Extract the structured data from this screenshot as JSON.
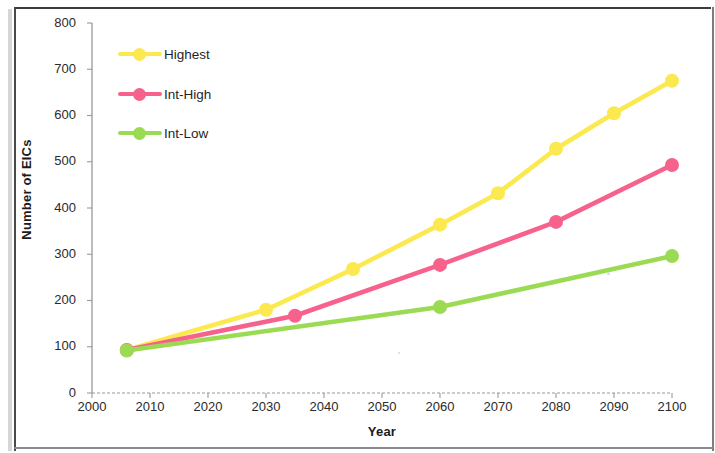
{
  "chart_data": {
    "type": "line",
    "title": "",
    "xlabel": "Year",
    "ylabel": "Number of EICs",
    "xlim": [
      2000,
      2100
    ],
    "ylim": [
      0,
      800
    ],
    "xticks": [
      2000,
      2010,
      2020,
      2030,
      2040,
      2050,
      2060,
      2070,
      2080,
      2090,
      2100
    ],
    "yticks": [
      0,
      100,
      200,
      300,
      400,
      500,
      600,
      700,
      800
    ],
    "grid": false,
    "legend_position": "upper-left-inside",
    "series": [
      {
        "name": "Highest",
        "color": "#FBE94F",
        "x": [
          2006,
          2030,
          2045,
          2060,
          2070,
          2080,
          2090,
          2100
        ],
        "values": [
          93,
          180,
          268,
          364,
          432,
          528,
          605,
          675
        ]
      },
      {
        "name": "Int-High",
        "color": "#F7628C",
        "x": [
          2006,
          2035,
          2060,
          2080,
          2100
        ],
        "values": [
          93,
          167,
          277,
          370,
          493
        ]
      },
      {
        "name": "Int-Low",
        "color": "#9BDB54",
        "x": [
          2006,
          2060,
          2100
        ],
        "values": [
          92,
          186,
          296
        ]
      }
    ]
  },
  "legend": {
    "items": [
      {
        "label": "Highest",
        "color": "#FBE94F"
      },
      {
        "label": "Int-High",
        "color": "#F7628C"
      },
      {
        "label": "Int-Low",
        "color": "#9BDB54"
      }
    ]
  },
  "axes": {
    "y_title": "Number of EICs",
    "x_title": "Year",
    "y_tick_labels": [
      "800",
      "700",
      "600",
      "500",
      "400",
      "300",
      "200",
      "100",
      "0"
    ],
    "x_tick_labels": [
      "2000",
      "2010",
      "2020",
      "2030",
      "2040",
      "2050",
      "2060",
      "2070",
      "2080",
      "2090",
      "2100"
    ]
  }
}
